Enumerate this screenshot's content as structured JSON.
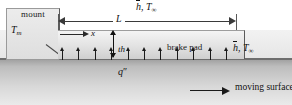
{
  "figure": {
    "type": "thermal-schematic"
  },
  "mount": {
    "label": "mount",
    "temperature_label": "T",
    "temperature_sub": "m"
  },
  "pad": {
    "label": "brake pad"
  },
  "convection_top": {
    "h_symbol": "h",
    "separator": ", ",
    "t_symbol": "T",
    "t_sub": "∞"
  },
  "convection_right": {
    "h_symbol": "h",
    "separator": ", ",
    "t_symbol": "T",
    "t_sub": "∞"
  },
  "dimensions": {
    "length_label": "L",
    "thickness_label": "th",
    "x_axis_label": "x"
  },
  "heat_flux": {
    "label": "q",
    "primes": "″",
    "arrow_count": 11
  },
  "moving_surface": {
    "label": "moving surface"
  },
  "colors": {
    "surface_dark": "#9a9a9a",
    "pad_fill": "#e2e2e2",
    "mount_fill": "#ececec",
    "line": "#1a1a1a"
  }
}
